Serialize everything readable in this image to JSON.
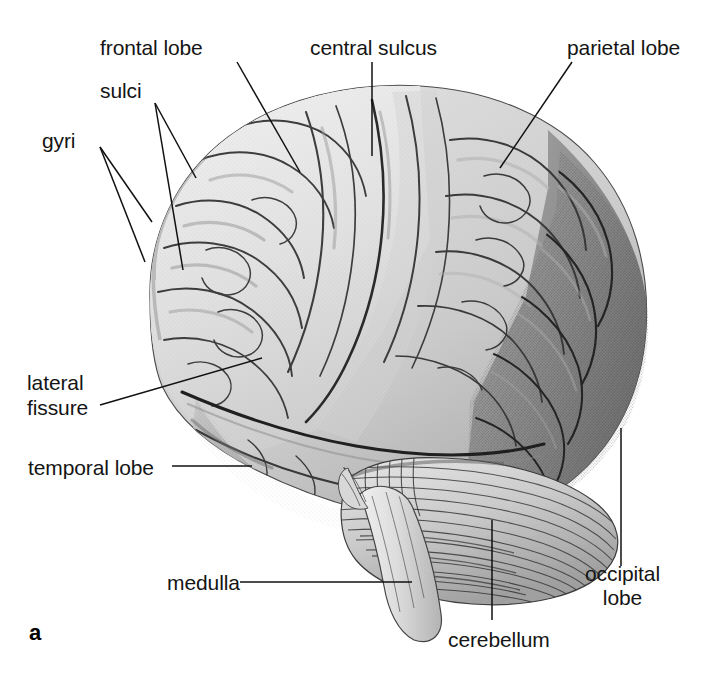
{
  "figure": {
    "panel_letter": "a",
    "style": "grayscale-engraving",
    "background_color": "#ffffff",
    "ink_color": "#151515"
  },
  "labels": {
    "frontal_lobe": "frontal lobe",
    "sulci": "sulci",
    "gyri": "gyri",
    "central_sulcus": "central sulcus",
    "parietal_lobe": "parietal lobe",
    "lateral_fissure_line1": "lateral",
    "lateral_fissure_line2": "fissure",
    "temporal_lobe": "temporal lobe",
    "medulla": "medulla",
    "cerebellum": "cerebellum",
    "occipital_lobe_line1": "occipital",
    "occipital_lobe_line2": "lobe"
  },
  "icons": {
    "brain-illustration": "brain-icon",
    "cerebellum-region": "cerebellum-icon",
    "medulla-region": "medulla-icon"
  }
}
